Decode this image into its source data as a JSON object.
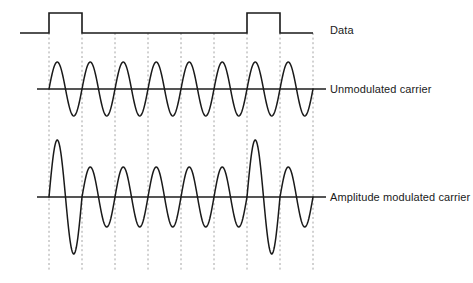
{
  "figure": {
    "width": 473,
    "height": 283,
    "background_color": "#ffffff",
    "trace_color": "#1a1a1a",
    "baseline_color": "#555555",
    "gridline_color": "#9a9a9a"
  },
  "labels": {
    "data": "Data",
    "unmodulated": "Unmodulated carrier",
    "amplitude_modulated": "Amplitude modulated carrier"
  },
  "chart_data": {
    "type": "line",
    "xlabel": "",
    "ylabel": "",
    "grid": true,
    "gridline_style": "dashed-vertical",
    "legend_position": "right-inline",
    "bit_interval_px": 33,
    "bit_boundaries_px": [
      49,
      82,
      115,
      148,
      181,
      214,
      247,
      280,
      313
    ],
    "bit_values": [
      1,
      0,
      0,
      0,
      0,
      0,
      1,
      0
    ],
    "series": [
      {
        "name": "Data",
        "type": "square",
        "baseline_y": 33,
        "high_y": 13,
        "low_y": 33,
        "lead_in_x": 20,
        "lead_out_x": 313,
        "levels": [
          1,
          0,
          0,
          0,
          0,
          0,
          1,
          0
        ]
      },
      {
        "name": "Unmodulated carrier",
        "type": "sine",
        "baseline_y": 89,
        "amplitude_px": 27,
        "cycles": 8,
        "cycles_per_bit": 1,
        "amplitudes": [
          27,
          27,
          27,
          27,
          27,
          27,
          27,
          27
        ]
      },
      {
        "name": "Amplitude modulated carrier",
        "type": "sine",
        "baseline_y": 197,
        "amplitude_high_px": 57,
        "amplitude_low_px": 30,
        "cycles": 8,
        "cycles_per_bit": 1,
        "amplitudes": [
          57,
          30,
          30,
          30,
          30,
          30,
          57,
          30
        ]
      }
    ]
  }
}
